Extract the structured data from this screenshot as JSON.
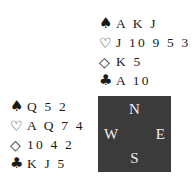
{
  "hands": {
    "north": {
      "spades": {
        "symbol": "♠",
        "icon": "spade-icon",
        "cards": "A K J"
      },
      "hearts": {
        "symbol": "♡",
        "icon": "heart-icon",
        "cards": "J 10 9 5 3 2"
      },
      "diamonds": {
        "symbol": "◇",
        "icon": "diamond-icon",
        "cards": "K 5"
      },
      "clubs": {
        "symbol": "♣",
        "icon": "club-icon",
        "cards": "A 10"
      }
    },
    "west": {
      "spades": {
        "symbol": "♠",
        "icon": "spade-icon",
        "cards": "Q 5 2"
      },
      "hearts": {
        "symbol": "♡",
        "icon": "heart-icon",
        "cards": "A Q 7 4"
      },
      "diamonds": {
        "symbol": "◇",
        "icon": "diamond-icon",
        "cards": "10 4 2"
      },
      "clubs": {
        "symbol": "♣",
        "icon": "club-icon",
        "cards": "K J 5"
      }
    }
  },
  "compass": {
    "north": "N",
    "south": "S",
    "east": "E",
    "west": "W",
    "background_color": "#3b3b3b",
    "text_color": "#eeeeee"
  }
}
